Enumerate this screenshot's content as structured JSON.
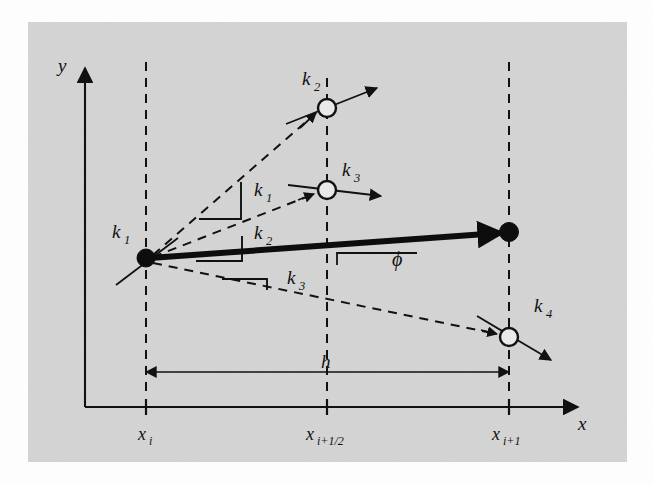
{
  "figure": {
    "background_color": "#d4d4d4",
    "page_color": "#ffffff",
    "ink_color": "#111111"
  },
  "axes": {
    "y_label": "y",
    "x_label": "x",
    "ticks": [
      {
        "id": "xi",
        "base": "x",
        "sub": "i",
        "x": 146
      },
      {
        "id": "xihalf",
        "base": "x",
        "sub": "i+1/2",
        "x": 327
      },
      {
        "id": "xi1",
        "base": "x",
        "sub": "i+1",
        "x": 509
      }
    ]
  },
  "dimension": {
    "label": "h",
    "from_tick": "xi",
    "to_tick": "xi1"
  },
  "angle": {
    "label": "ϕ"
  },
  "slope_labels": [
    {
      "id": "k1-origin",
      "base": "k",
      "sub": "1",
      "x": 112,
      "y": 238
    },
    {
      "id": "k2-node",
      "base": "k",
      "sub": "2",
      "x": 305,
      "y": 85
    },
    {
      "id": "k3-node",
      "base": "k",
      "sub": "3",
      "x": 345,
      "y": 176
    },
    {
      "id": "k4-node",
      "base": "k",
      "sub": "4",
      "x": 537,
      "y": 312
    },
    {
      "id": "k1-tri",
      "base": "k",
      "sub": "1",
      "x": 258,
      "y": 196
    },
    {
      "id": "k2-tri",
      "base": "k",
      "sub": "2",
      "x": 258,
      "y": 239
    },
    {
      "id": "k3-tri",
      "base": "k",
      "sub": "3",
      "x": 290,
      "y": 284
    }
  ],
  "nodes": [
    {
      "id": "start",
      "kind": "filled",
      "cx": 146,
      "cy": 258,
      "r": 9.0
    },
    {
      "id": "k2-point",
      "kind": "open",
      "cx": 327,
      "cy": 108,
      "r": 9.0
    },
    {
      "id": "k3-point",
      "kind": "open",
      "cx": 327,
      "cy": 190,
      "r": 9.0
    },
    {
      "id": "end",
      "kind": "filled",
      "cx": 509,
      "cy": 232,
      "r": 9.5
    },
    {
      "id": "k4-point",
      "kind": "open",
      "cx": 509,
      "cy": 337,
      "r": 9.0
    }
  ]
}
